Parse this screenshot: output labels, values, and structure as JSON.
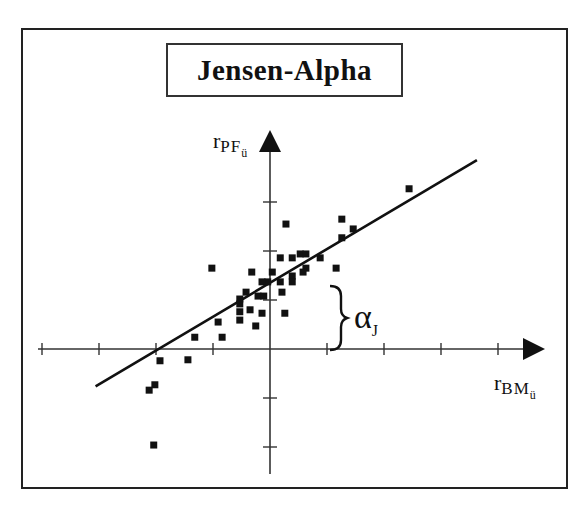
{
  "title": "Jensen-Alpha",
  "y_axis_label": {
    "main": "r",
    "sub": "PF",
    "subsub": "ü"
  },
  "x_axis_label": {
    "main": "r",
    "sub": "BM",
    "subsub": "ü"
  },
  "annotation": {
    "symbol": "α",
    "subscript": "J",
    "meaning": "intercept brace"
  },
  "colors": {
    "ink": "#111111",
    "background": "#ffffff"
  },
  "chart_data": {
    "type": "scatter",
    "title": "Jensen-Alpha",
    "xlabel": "r_BM_ü",
    "ylabel": "r_PF_ü",
    "axes_through_origin": true,
    "grid": false,
    "x_ticks": [
      -4,
      -3,
      -2,
      -1,
      1,
      2,
      3,
      4
    ],
    "y_ticks": [
      -2,
      -1,
      1,
      2,
      3
    ],
    "xlim": [
      -4.1,
      4.8
    ],
    "ylim": [
      -2.6,
      4.4
    ],
    "regression_line": {
      "intercept": 1.35,
      "slope": 0.69,
      "x_start": -3.06,
      "x_end": 3.63,
      "label": "α_J (intercept)"
    },
    "points": [
      {
        "x": 2.44,
        "y": 3.27
      },
      {
        "x": 1.26,
        "y": 2.65
      },
      {
        "x": 1.46,
        "y": 2.45
      },
      {
        "x": 1.26,
        "y": 2.27
      },
      {
        "x": 0.28,
        "y": 2.55
      },
      {
        "x": 0.18,
        "y": 1.86
      },
      {
        "x": 0.39,
        "y": 1.86
      },
      {
        "x": 0.53,
        "y": 1.94
      },
      {
        "x": 0.63,
        "y": 1.94
      },
      {
        "x": 0.88,
        "y": 1.86
      },
      {
        "x": 0.63,
        "y": 1.65
      },
      {
        "x": 1.16,
        "y": 1.65
      },
      {
        "x": 0.58,
        "y": 1.57
      },
      {
        "x": 0.39,
        "y": 1.49
      },
      {
        "x": 0.18,
        "y": 1.37
      },
      {
        "x": 0.39,
        "y": 1.37
      },
      {
        "x": 0.04,
        "y": 1.57
      },
      {
        "x": -0.04,
        "y": 1.37
      },
      {
        "x": -0.14,
        "y": 1.37
      },
      {
        "x": 0.21,
        "y": 1.16
      },
      {
        "x": -1.02,
        "y": 1.65
      },
      {
        "x": -0.32,
        "y": 1.57
      },
      {
        "x": -0.42,
        "y": 1.16
      },
      {
        "x": -0.53,
        "y": 1.02
      },
      {
        "x": -0.53,
        "y": 0.92
      },
      {
        "x": -0.21,
        "y": 1.08
      },
      {
        "x": -0.11,
        "y": 1.08
      },
      {
        "x": 0.26,
        "y": 0.73
      },
      {
        "x": -0.14,
        "y": 0.73
      },
      {
        "x": -0.53,
        "y": 0.76
      },
      {
        "x": -0.35,
        "y": 0.8
      },
      {
        "x": -0.53,
        "y": 0.59
      },
      {
        "x": -0.91,
        "y": 0.55
      },
      {
        "x": -0.25,
        "y": 0.47
      },
      {
        "x": -0.84,
        "y": 0.24
      },
      {
        "x": -1.32,
        "y": 0.24
      },
      {
        "x": -1.44,
        "y": -0.22
      },
      {
        "x": -1.93,
        "y": -0.24
      },
      {
        "x": -2.02,
        "y": -0.73
      },
      {
        "x": -2.12,
        "y": -0.84
      },
      {
        "x": -2.04,
        "y": -1.96
      }
    ]
  }
}
